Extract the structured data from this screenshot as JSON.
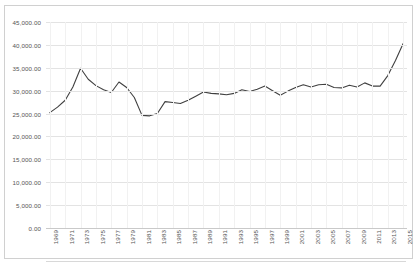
{
  "chart_data": {
    "type": "line",
    "title": "",
    "subtitle": "",
    "xlabel": "",
    "ylabel": "",
    "ylim": [
      0,
      45000
    ],
    "ytick_step": 5000,
    "grid": true,
    "legend": false,
    "legend_position": "none",
    "line_color": "#404040",
    "background_color": "#ffffff",
    "gridline_color": "#e3e3e3",
    "border_color": "#d0d0d0",
    "ytick_labels": [
      "45,000.00",
      "40,000.00",
      "35,000.00",
      "30,000.00",
      "25,000.00",
      "20,000.00",
      "15,000.00",
      "10,000.00",
      "5,000.00",
      "0.00"
    ],
    "ytick_values": [
      45000,
      40000,
      35000,
      30000,
      25000,
      20000,
      15000,
      10000,
      5000,
      0
    ],
    "xtick_labels": [
      "1969",
      "1971",
      "1973",
      "1975",
      "1977",
      "1979",
      "1981",
      "1983",
      "1985",
      "1987",
      "1989",
      "1991",
      "1993",
      "1995",
      "1997",
      "1999",
      "2001",
      "2003",
      "2005",
      "2007",
      "2009",
      "2011",
      "2013",
      "2015"
    ],
    "x": [
      1969,
      1970,
      1971,
      1972,
      1973,
      1974,
      1975,
      1976,
      1977,
      1978,
      1979,
      1980,
      1981,
      1982,
      1983,
      1984,
      1985,
      1986,
      1987,
      1988,
      1989,
      1990,
      1991,
      1992,
      1993,
      1994,
      1995,
      1996,
      1997,
      1998,
      1999,
      2000,
      2001,
      2002,
      2003,
      2004,
      2005,
      2006,
      2007,
      2008,
      2009,
      2010,
      2011,
      2012,
      2013,
      2014,
      2015
    ],
    "values": [
      25200,
      26400,
      27900,
      30800,
      34900,
      32500,
      31100,
      30200,
      29600,
      31900,
      30700,
      28500,
      24600,
      24500,
      25000,
      27600,
      27400,
      27200,
      27900,
      28800,
      29700,
      29400,
      29300,
      29100,
      29400,
      30200,
      29800,
      30300,
      31000,
      30000,
      29000,
      29900,
      30700,
      31300,
      30800,
      31300,
      31400,
      30700,
      30600,
      31200,
      30800,
      31700,
      31000,
      31000,
      33300,
      36600,
      40300
    ],
    "series_name": "Series 1",
    "annotations": []
  }
}
